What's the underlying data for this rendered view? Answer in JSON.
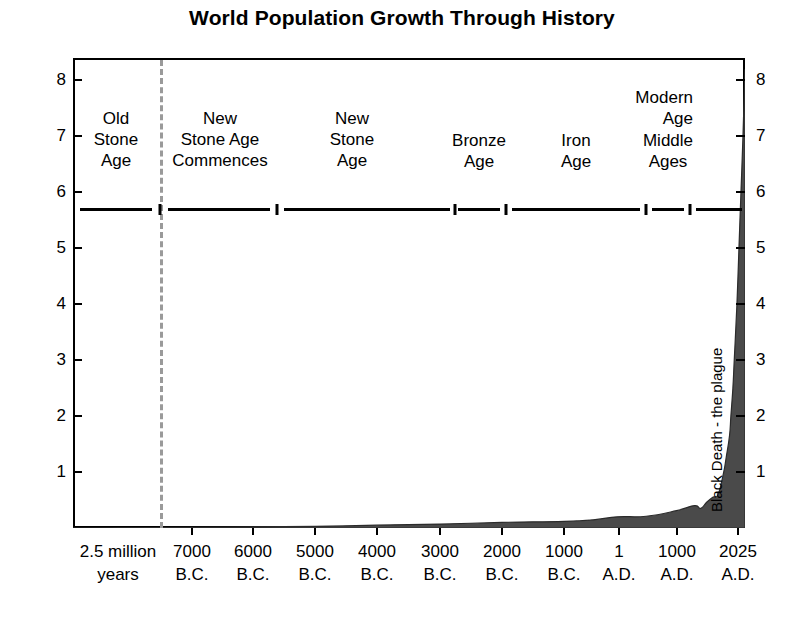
{
  "chart": {
    "title": "World Population Growth Through History",
    "ylabel": "Billions of people",
    "yticks": [
      "1",
      "2",
      "3",
      "4",
      "5",
      "6",
      "7",
      "8"
    ],
    "xticks": [
      {
        "line1": "2.5 million",
        "line2": "years"
      },
      {
        "line1": "7000",
        "line2": "B.C."
      },
      {
        "line1": "6000",
        "line2": "B.C."
      },
      {
        "line1": "5000",
        "line2": "B.C."
      },
      {
        "line1": "4000",
        "line2": "B.C."
      },
      {
        "line1": "3000",
        "line2": "B.C."
      },
      {
        "line1": "2000",
        "line2": "B.C."
      },
      {
        "line1": "1000",
        "line2": "B.C."
      },
      {
        "line1": "1",
        "line2": "A.D."
      },
      {
        "line1": "1000",
        "line2": "A.D."
      },
      {
        "line1": "2025",
        "line2": "A.D."
      }
    ],
    "eras": [
      {
        "line1": "Old",
        "line2": "Stone",
        "line3": "Age"
      },
      {
        "line1": "New",
        "line2": "Stone Age",
        "line3": "Commences"
      },
      {
        "line1": "New",
        "line2": "Stone",
        "line3": "Age"
      },
      {
        "line1": "",
        "line2": "Bronze",
        "line3": "Age"
      },
      {
        "line1": "",
        "line2": "Iron",
        "line3": "Age"
      },
      {
        "line1": "",
        "line2": "Middle",
        "line3": "Ages"
      },
      {
        "line1": "Modern",
        "line2": "Age",
        "line3": ""
      }
    ],
    "annotation": "Black Death - the plague",
    "colors": {
      "area_fill": "#4a4a4a",
      "axis": "#000000",
      "dashed_line": "#9a9a9a",
      "background": "#ffffff"
    }
  },
  "chart_data": {
    "type": "area",
    "title": "World Population Growth Through History",
    "xlabel": "",
    "ylabel": "Billions of people",
    "ylim": [
      0,
      8.4
    ],
    "grid": false,
    "legend": null,
    "x_tick_labels": [
      "2.5 million years",
      "7000 B.C.",
      "6000 B.C.",
      "5000 B.C.",
      "4000 B.C.",
      "3000 B.C.",
      "2000 B.C.",
      "1000 B.C.",
      "1 A.D.",
      "1000 A.D.",
      "2025 A.D."
    ],
    "y_tick_values": [
      1,
      2,
      3,
      4,
      5,
      6,
      7,
      8
    ],
    "era_bands": [
      {
        "label": "Old Stone Age",
        "start_x_frac": 0.0,
        "end_x_frac": 0.13
      },
      {
        "label": "New Stone Age Commences",
        "start_x_frac": 0.13,
        "end_x_frac": 0.305
      },
      {
        "label": "New Stone Age",
        "start_x_frac": 0.305,
        "end_x_frac": 0.568
      },
      {
        "label": "Bronze Age",
        "start_x_frac": 0.568,
        "end_x_frac": 0.643
      },
      {
        "label": "Iron Age",
        "start_x_frac": 0.643,
        "end_x_frac": 0.851
      },
      {
        "label": "Middle Ages",
        "start_x_frac": 0.851,
        "end_x_frac": 0.918
      },
      {
        "label": "Modern Age",
        "start_x_frac": 0.918,
        "end_x_frac": 1.0
      }
    ],
    "annotations": [
      {
        "text": "Black Death - the plague",
        "x_label": "1300s A.D.",
        "rotation": 90
      }
    ],
    "series": [
      {
        "name": "World population",
        "units": "billions",
        "x": [
          "2.5 million years",
          "7000 B.C.",
          "6000 B.C.",
          "5000 B.C.",
          "4000 B.C.",
          "3000 B.C.",
          "2000 B.C.",
          "1000 B.C.",
          "500 B.C.",
          "1 A.D.",
          "500 A.D.",
          "1000 A.D.",
          "1300 A.D.",
          "1400 A.D.",
          "1500 A.D.",
          "1600 A.D.",
          "1700 A.D.",
          "1800 A.D.",
          "1850 A.D.",
          "1900 A.D.",
          "1927 A.D.",
          "1950 A.D.",
          "1960 A.D.",
          "1975 A.D.",
          "1987 A.D.",
          "1999 A.D.",
          "2011 A.D.",
          "2025 A.D."
        ],
        "values": [
          0.0,
          0.01,
          0.02,
          0.03,
          0.05,
          0.07,
          0.1,
          0.12,
          0.15,
          0.2,
          0.21,
          0.31,
          0.4,
          0.35,
          0.46,
          0.55,
          0.6,
          0.98,
          1.26,
          1.65,
          2.0,
          2.5,
          3.0,
          4.0,
          5.0,
          6.0,
          7.0,
          8.2
        ]
      }
    ]
  }
}
